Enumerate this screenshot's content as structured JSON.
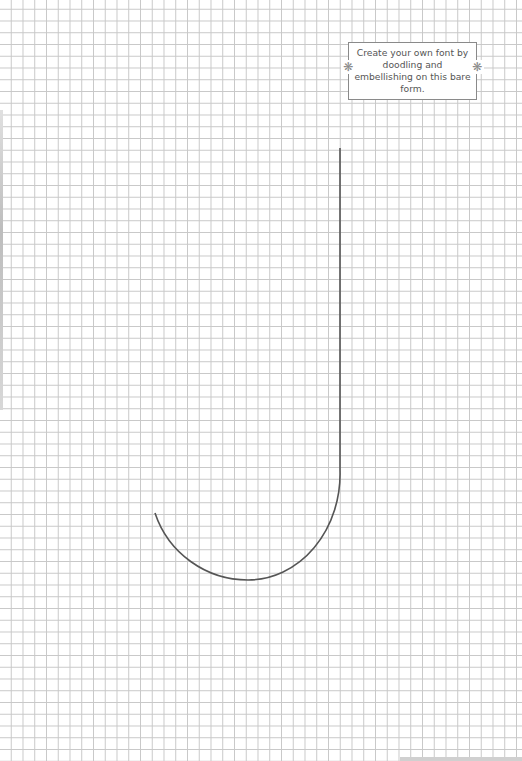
{
  "page": {
    "background": "#ffffff",
    "grid_color": "#c8c8c8",
    "grid_spacing_px": 11.75
  },
  "note": {
    "text": "Create your own font by doodling and embellishing on this bare form.",
    "border_color": "#8a8a8a",
    "decorations": [
      {
        "icon": "flower-icon",
        "glyph": "❋",
        "side": "left"
      },
      {
        "icon": "flower-icon",
        "glyph": "❋",
        "side": "right"
      }
    ]
  },
  "letterform": {
    "letter": "J",
    "stroke_color": "#555555"
  }
}
